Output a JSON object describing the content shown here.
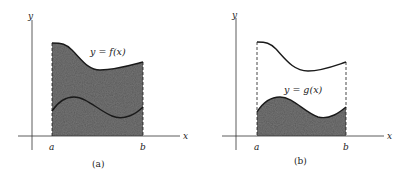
{
  "figure": {
    "panels": [
      {
        "id": "a",
        "caption": "(a)",
        "curve_label": "y = f(x)",
        "axis_x_label": "x",
        "axis_y_label": "y",
        "tick_a": "a",
        "tick_b": "b",
        "shaded_region": "area under f(x) from a to b"
      },
      {
        "id": "b",
        "caption": "(b)",
        "curve_label": "y = g(x)",
        "axis_x_label": "x",
        "axis_y_label": "y",
        "tick_a": "a",
        "tick_b": "b",
        "shaded_region": "area under g(x) from a to b"
      }
    ],
    "colors": {
      "shade": "#5a5a5a",
      "line": "#1a1a1a",
      "background": "#ffffff"
    }
  }
}
